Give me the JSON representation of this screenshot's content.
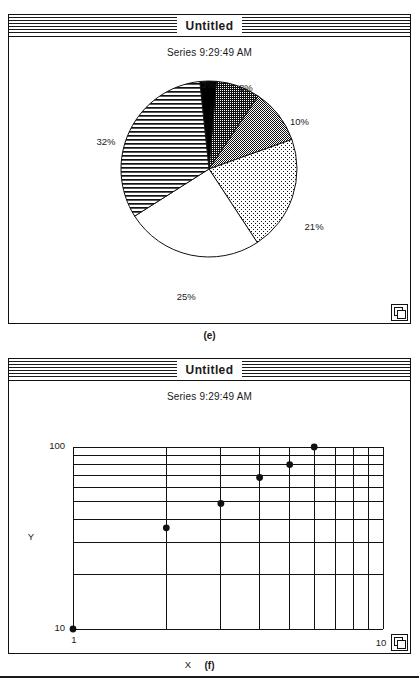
{
  "page": {
    "background": "#ffffff",
    "ink": "#1a1a1a"
  },
  "figures": [
    {
      "caption": "(e)",
      "window": {
        "title": "Untitled",
        "grow_box_icon": "resize-grow-box-icon"
      },
      "chart_subtitle": "Series 9:29:49 AM"
    },
    {
      "caption": "(f)",
      "window": {
        "title": "Untitled",
        "grow_box_icon": "resize-grow-box-icon"
      },
      "chart_subtitle": "Series 9:29:49 AM"
    }
  ],
  "chart_data": [
    {
      "type": "pie",
      "title": "Series 9:29:49 AM",
      "labels": [
        "3%",
        "8%",
        "10%",
        "21%",
        "25%",
        "32%"
      ],
      "values": [
        3,
        8,
        10,
        21,
        25,
        32
      ],
      "value_unit": "percent",
      "start_angle_deg": 0,
      "direction": "clockwise",
      "legend": "none",
      "slice_fills": [
        "solid-black",
        "dark-dither",
        "medium-gray-dither",
        "light-dither",
        "white",
        "horizontal-lines"
      ],
      "slice_colors": [
        "#000000",
        "#4a4a4a",
        "#8c8c8c",
        "#cdcdcd",
        "#ffffff",
        "#ffffff"
      ],
      "data_labels_outside": true
    },
    {
      "type": "scatter",
      "title": "Series 9:29:49 AM",
      "xlabel": "X",
      "ylabel": "Y",
      "xscale": "log",
      "yscale": "log",
      "xlim": [
        1,
        10
      ],
      "ylim": [
        10,
        100
      ],
      "xticks": [
        1,
        10
      ],
      "xtick_labels": [
        "1",
        "10"
      ],
      "yticks": [
        10,
        100
      ],
      "ytick_labels": [
        "10",
        "100"
      ],
      "grid": true,
      "grid_minor_x": [
        2,
        3,
        4,
        5,
        6,
        7,
        8,
        9
      ],
      "grid_minor_y": [
        20,
        30,
        40,
        50,
        60,
        70,
        80,
        90
      ],
      "x": [
        1,
        2,
        3,
        4,
        5,
        6
      ],
      "y": [
        10,
        36,
        49,
        68,
        80,
        100
      ],
      "marker": "filled-circle",
      "marker_color": "#111111"
    }
  ]
}
